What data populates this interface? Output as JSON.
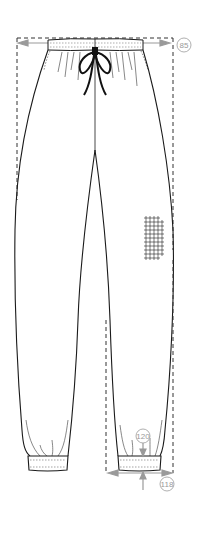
{
  "figure": {
    "garment": "drawstring jogger trousers, front view",
    "colors": {
      "outline": "#1a1a1a",
      "stitch": "#555555",
      "dimension": "#9a9a9a",
      "background": "#ffffff"
    }
  },
  "measurements": [
    {
      "id": "waist-width",
      "label": "85",
      "description": "waist width (edge to edge)"
    },
    {
      "id": "cuff-height",
      "label": "120",
      "description": "leg cuff height"
    },
    {
      "id": "leg-opening",
      "label": "118",
      "description": "leg opening width"
    }
  ],
  "details": {
    "waistband": "elasticated waistband with drawstring",
    "cuffs": "elastic ribbed ankle cuffs",
    "swatch": "grid fabric swatch marker on right leg"
  }
}
